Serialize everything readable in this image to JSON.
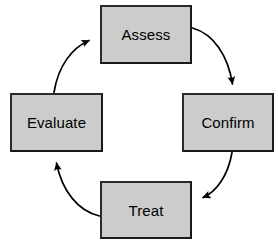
{
  "diagram": {
    "type": "cycle",
    "direction": "clockwise",
    "style": {
      "node_fill": "#cccccc",
      "node_border": "#1a1a1a",
      "arrow_color": "#000000",
      "background": "#ffffff",
      "text_color": "#000000"
    },
    "nodes": [
      {
        "id": "assess",
        "label": "Assess",
        "position": "top"
      },
      {
        "id": "confirm",
        "label": "Confirm",
        "position": "right"
      },
      {
        "id": "treat",
        "label": "Treat",
        "position": "bottom"
      },
      {
        "id": "evaluate",
        "label": "Evaluate",
        "position": "left"
      }
    ],
    "edges": [
      {
        "id": "assess-to-confirm",
        "from": "Assess",
        "to": "Confirm",
        "label": "",
        "style": "curved-arrow"
      },
      {
        "id": "confirm-to-treat",
        "from": "Confirm",
        "to": "Treat",
        "label": "",
        "style": "curved-arrow"
      },
      {
        "id": "treat-to-evaluate",
        "from": "Treat",
        "to": "Evaluate",
        "label": "",
        "style": "curved-arrow"
      },
      {
        "id": "evaluate-to-assess",
        "from": "Evaluate",
        "to": "Assess",
        "label": "",
        "style": "curved-arrow"
      }
    ]
  }
}
